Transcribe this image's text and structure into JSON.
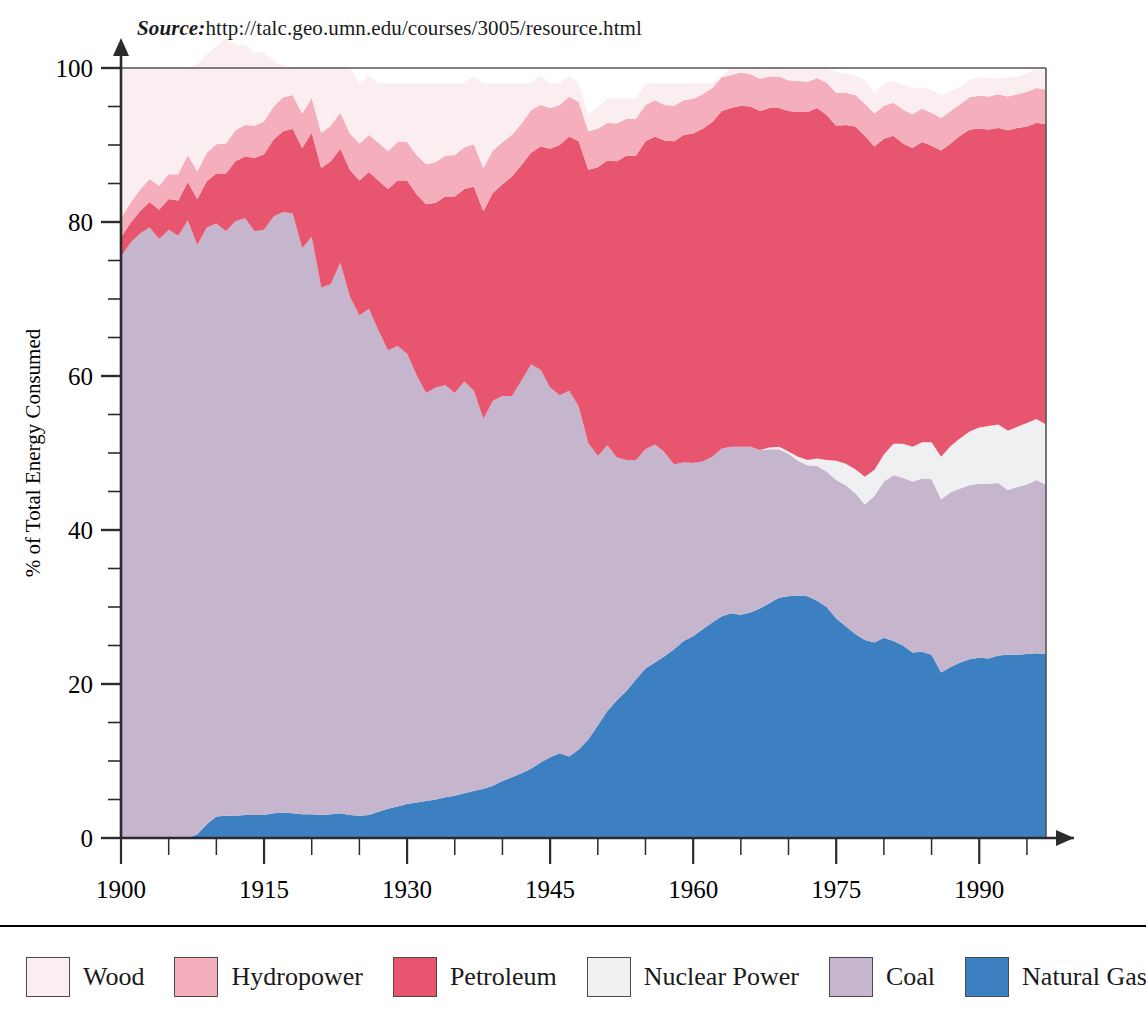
{
  "source": {
    "label": "Source:",
    "url": "http://talc.geo.umn.edu/courses/3005/resource.html"
  },
  "legend": {
    "items": [
      {
        "label": "Wood",
        "color": "#faeef1"
      },
      {
        "label": "Hydropower",
        "color": "#f5aebc"
      },
      {
        "label": "Petroleum",
        "color": "#e8556e"
      },
      {
        "label": "Nuclear Power",
        "color": "#eef0f1"
      },
      {
        "label": "Coal",
        "color": "#c5b6cd"
      },
      {
        "label": "Natural Gas",
        "color": "#3d80c2"
      }
    ]
  },
  "chart_data": {
    "type": "area",
    "title": "",
    "subtitle": "",
    "xlabel": "Year",
    "ylabel": "% of Total Energy Consumed",
    "xlim": [
      1900,
      1997
    ],
    "ylim": [
      0,
      100
    ],
    "xticks": [
      1900,
      1915,
      1930,
      1945,
      1960,
      1975,
      1990
    ],
    "xticks_minor_step": 5,
    "yticks": [
      0,
      20,
      40,
      60,
      80,
      100
    ],
    "yticks_minor_step": 5,
    "grid": false,
    "legend_position": "bottom",
    "stacked": true,
    "stack_order_bottom_to_top": [
      "Natural Gas",
      "Coal",
      "Nuclear Power",
      "Petroleum",
      "Hydropower",
      "Wood"
    ],
    "x": [
      1900,
      1901,
      1902,
      1903,
      1904,
      1905,
      1906,
      1907,
      1908,
      1909,
      1910,
      1911,
      1912,
      1913,
      1914,
      1915,
      1916,
      1917,
      1918,
      1919,
      1920,
      1921,
      1922,
      1923,
      1924,
      1925,
      1926,
      1927,
      1928,
      1929,
      1930,
      1931,
      1932,
      1933,
      1934,
      1935,
      1936,
      1937,
      1938,
      1939,
      1940,
      1941,
      1942,
      1943,
      1944,
      1945,
      1946,
      1947,
      1948,
      1949,
      1950,
      1951,
      1952,
      1953,
      1954,
      1955,
      1956,
      1957,
      1958,
      1959,
      1960,
      1961,
      1962,
      1963,
      1964,
      1965,
      1966,
      1967,
      1968,
      1969,
      1970,
      1971,
      1972,
      1973,
      1974,
      1975,
      1976,
      1977,
      1978,
      1979,
      1980,
      1981,
      1982,
      1983,
      1984,
      1985,
      1986,
      1987,
      1988,
      1989,
      1990,
      1991,
      1992,
      1993,
      1994,
      1995,
      1996,
      1997
    ],
    "series": [
      {
        "name": "Natural Gas",
        "color": "#3d80c2",
        "values": [
          0,
          0,
          0,
          0,
          0,
          0,
          0,
          0,
          0.5,
          1.8,
          2.8,
          2.9,
          2.9,
          3.0,
          3.0,
          3.0,
          3.2,
          3.3,
          3.2,
          3.1,
          3.1,
          3.0,
          3.1,
          3.2,
          3.0,
          2.9,
          3.0,
          3.4,
          3.8,
          4.1,
          4.4,
          4.6,
          4.8,
          5.0,
          5.3,
          5.5,
          5.8,
          6.1,
          6.4,
          6.8,
          7.4,
          7.9,
          8.4,
          9.0,
          9.8,
          10.5,
          11.0,
          10.6,
          11.5,
          12.8,
          14.6,
          16.5,
          17.9,
          19.1,
          20.6,
          22.0,
          22.8,
          23.6,
          24.5,
          25.6,
          26.2,
          27.1,
          28.0,
          28.8,
          29.2,
          29.0,
          29.3,
          29.8,
          30.5,
          31.2,
          31.4,
          31.5,
          31.4,
          30.8,
          30.0,
          28.5,
          27.5,
          26.5,
          25.7,
          25.4,
          26.0,
          25.6,
          25.0,
          24.1,
          24.2,
          23.8,
          21.5,
          22.2,
          22.8,
          23.2,
          23.4,
          23.3,
          23.7,
          23.8,
          23.8,
          23.9,
          24.0,
          23.9
        ]
      },
      {
        "name": "Coal",
        "color": "#c5b6cd",
        "values": [
          75.5,
          77.3,
          78.5,
          79.3,
          77.8,
          79.0,
          78.2,
          80.2,
          76.5,
          77.5,
          77.0,
          75.9,
          77.2,
          77.5,
          75.8,
          76.0,
          77.5,
          78.0,
          77.9,
          73.5,
          75.0,
          68.5,
          68.8,
          71.5,
          67.3,
          65.0,
          65.7,
          62.5,
          59.5,
          59.8,
          58.5,
          55.5,
          53.0,
          53.5,
          53.5,
          52.3,
          53.5,
          52.0,
          48.0,
          50.0,
          50.0,
          49.5,
          51.0,
          52.5,
          51.0,
          48.0,
          46.5,
          47.5,
          44.5,
          38.5,
          35.0,
          34.5,
          31.5,
          30.0,
          28.5,
          28.5,
          28.3,
          26.5,
          24.0,
          23.2,
          22.5,
          21.8,
          21.5,
          21.8,
          21.6,
          21.8,
          21.5,
          20.6,
          20.0,
          19.3,
          18.5,
          17.5,
          17.0,
          17.5,
          17.6,
          18.0,
          18.3,
          18.3,
          17.6,
          19.0,
          20.3,
          21.5,
          21.8,
          22.2,
          22.5,
          22.8,
          22.5,
          22.7,
          22.6,
          22.6,
          22.6,
          22.7,
          22.4,
          21.4,
          21.8,
          22.0,
          22.5,
          22.0
        ]
      },
      {
        "name": "Nuclear Power",
        "color": "#eef0f1",
        "values": [
          0,
          0,
          0,
          0,
          0,
          0,
          0,
          0,
          0,
          0,
          0,
          0,
          0,
          0,
          0,
          0,
          0,
          0,
          0,
          0,
          0,
          0,
          0,
          0,
          0,
          0,
          0,
          0,
          0,
          0,
          0,
          0,
          0,
          0,
          0,
          0,
          0,
          0,
          0,
          0,
          0,
          0,
          0,
          0,
          0,
          0,
          0,
          0,
          0,
          0,
          0,
          0,
          0,
          0,
          0,
          0,
          0,
          0,
          0,
          0,
          0,
          0,
          0,
          0,
          0,
          0,
          0,
          0,
          0.2,
          0.3,
          0.3,
          0.5,
          0.7,
          1.0,
          1.5,
          2.5,
          2.8,
          3.1,
          3.6,
          3.4,
          3.5,
          4.1,
          4.4,
          4.5,
          4.7,
          4.8,
          5.5,
          6.0,
          6.5,
          7.0,
          7.3,
          7.5,
          7.6,
          7.7,
          7.8,
          8.0,
          7.9,
          7.8
        ]
      },
      {
        "name": "Petroleum",
        "color": "#e8556e",
        "values": [
          2.5,
          2.6,
          2.9,
          3.3,
          3.8,
          4.0,
          4.6,
          5.0,
          6.0,
          6.0,
          6.5,
          7.5,
          7.8,
          8.0,
          9.5,
          9.8,
          10.0,
          10.5,
          11.0,
          13.0,
          13.5,
          15.5,
          16.0,
          14.8,
          16.5,
          17.5,
          17.8,
          19.5,
          21.0,
          21.5,
          22.5,
          23.5,
          24.5,
          24.0,
          24.5,
          25.5,
          25.0,
          26.5,
          27.0,
          27.0,
          27.5,
          28.5,
          28.0,
          27.5,
          29.0,
          31.0,
          32.5,
          33.0,
          34.5,
          35.5,
          37.5,
          37.0,
          38.5,
          39.5,
          39.5,
          40.0,
          40.0,
          40.5,
          42.0,
          42.5,
          42.8,
          43.2,
          43.5,
          43.8,
          44.0,
          44.3,
          44.2,
          44.0,
          44.1,
          44.0,
          44.2,
          44.8,
          45.2,
          45.5,
          44.8,
          43.5,
          44.0,
          44.5,
          44.3,
          42.0,
          41.0,
          40.0,
          39.0,
          38.8,
          39.0,
          38.5,
          39.8,
          39.3,
          39.3,
          39.2,
          38.8,
          38.5,
          38.5,
          39.0,
          38.8,
          38.5,
          38.5,
          39.0
        ]
      },
      {
        "name": "Hydropower",
        "color": "#f5aebc",
        "values": [
          2.5,
          2.6,
          2.8,
          3.0,
          3.1,
          3.2,
          3.4,
          3.5,
          3.6,
          3.7,
          3.8,
          3.9,
          4.0,
          4.1,
          4.2,
          4.3,
          4.3,
          4.4,
          4.4,
          4.5,
          4.5,
          4.6,
          4.6,
          4.7,
          4.7,
          4.8,
          4.8,
          4.9,
          4.9,
          5.0,
          5.0,
          5.1,
          5.2,
          5.3,
          5.3,
          5.4,
          5.4,
          5.5,
          5.6,
          5.5,
          5.5,
          5.4,
          5.4,
          5.5,
          5.4,
          5.3,
          5.2,
          5.2,
          5.1,
          5.0,
          5.0,
          4.9,
          4.9,
          4.8,
          4.8,
          4.7,
          4.7,
          4.6,
          4.6,
          4.5,
          4.5,
          4.5,
          4.4,
          4.4,
          4.3,
          4.3,
          4.2,
          4.2,
          4.1,
          4.1,
          4.0,
          4.0,
          3.9,
          3.9,
          4.2,
          4.3,
          4.2,
          4.1,
          4.2,
          4.3,
          4.3,
          4.3,
          4.4,
          4.4,
          4.3,
          4.3,
          4.2,
          4.2,
          4.1,
          4.2,
          4.3,
          4.3,
          4.4,
          4.4,
          4.4,
          4.5,
          4.5,
          4.5
        ]
      },
      {
        "name": "Wood",
        "color": "#faeef1",
        "values": [
          19.5,
          17.5,
          15.8,
          14.4,
          15.3,
          13.8,
          13.8,
          11.3,
          13.9,
          12.8,
          12.7,
          13.7,
          11.1,
          10.4,
          9.5,
          8.9,
          6.0,
          4.1,
          3.5,
          5.9,
          3.9,
          8.4,
          7.5,
          5.8,
          8.5,
          7.8,
          7.7,
          7.7,
          8.8,
          7.6,
          7.6,
          9.3,
          10.5,
          10.2,
          9.4,
          9.3,
          8.3,
          8.9,
          11.0,
          8.7,
          7.6,
          6.7,
          5.2,
          3.5,
          3.8,
          3.2,
          2.8,
          2.7,
          2.4,
          2.2,
          2.9,
          3.1,
          3.2,
          2.6,
          2.6,
          2.8,
          2.2,
          2.8,
          2.9,
          2.2,
          2.0,
          1.4,
          0.6,
          0.2,
          0.9,
          0.6,
          0.8,
          1.4,
          1.1,
          1.1,
          1.6,
          1.7,
          1.8,
          1.3,
          1.9,
          2.7,
          2.5,
          2.5,
          3.1,
          2.6,
          2.9,
          2.8,
          3.2,
          3.4,
          2.8,
          2.9,
          3.0,
          2.6,
          2.2,
          2.3,
          2.4,
          2.4,
          2.0,
          2.5,
          2.3,
          2.4,
          2.5,
          2.5
        ]
      }
    ]
  }
}
